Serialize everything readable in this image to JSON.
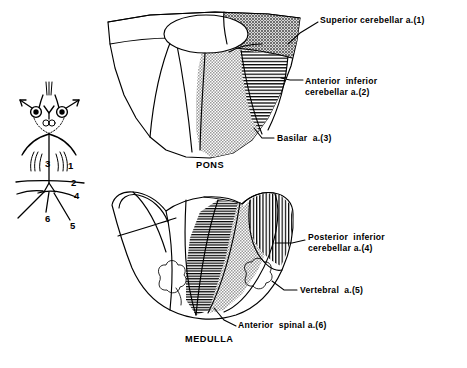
{
  "figure": {
    "background_color": "#ffffff",
    "ink_color": "#000000"
  },
  "sections": {
    "pons": {
      "region_label": "PONS",
      "labels": [
        {
          "id": "superior-cerebellar",
          "number": "1",
          "line1": "Superior cerebellar a.(1)",
          "line2": "",
          "pattern": "dark-stipple"
        },
        {
          "id": "anterior-inferior-cerebellar",
          "number": "2",
          "line1": "Anterior  inferior",
          "line2": "cerebellar a.(2)",
          "pattern": "horizontal-hatch"
        },
        {
          "id": "basilar",
          "number": "3",
          "line1": "Basilar  a.(3)",
          "line2": "",
          "pattern": "gray-stipple"
        }
      ]
    },
    "medulla": {
      "region_label": "MEDULLA",
      "labels": [
        {
          "id": "posterior-inferior-cerebellar",
          "number": "4",
          "line1": "Posterior  inferior",
          "line2": "cerebellar a.(4)",
          "pattern": "vertical-hatch"
        },
        {
          "id": "vertebral",
          "number": "5",
          "line1": "Vertebral  a.(5)",
          "line2": "",
          "pattern": "gray-stipple"
        },
        {
          "id": "anterior-spinal",
          "number": "6",
          "line1": "Anterior  spinal a.(6)",
          "line2": "",
          "pattern": "dense-horizontal-hatch"
        }
      ]
    },
    "schematic": {
      "description": "Vertebrobasilar arterial tree key diagram",
      "numbers": [
        {
          "id": "key-1",
          "value": "1"
        },
        {
          "id": "key-2",
          "value": "2"
        },
        {
          "id": "key-3",
          "value": "3"
        },
        {
          "id": "key-4",
          "value": "4"
        },
        {
          "id": "key-5",
          "value": "5"
        },
        {
          "id": "key-6",
          "value": "6"
        }
      ]
    }
  },
  "colors": {
    "gray_stipple": "#a8a8a8",
    "dark_stipple": "#8c8c8c",
    "hatch": "#000000",
    "white": "#ffffff"
  }
}
